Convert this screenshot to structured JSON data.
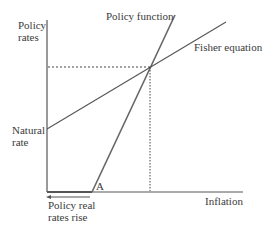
{
  "diagram": {
    "type": "economics-diagram",
    "y_axis_label": [
      "Policy",
      "rates"
    ],
    "x_axis_label": "Inflation",
    "curves": [
      {
        "name": "Policy function",
        "label": "Policy function"
      },
      {
        "name": "Fisher equation",
        "label": "Fisher equation"
      }
    ],
    "annotations": {
      "natural_rate": [
        "Natural",
        "rate"
      ],
      "point_a": "A",
      "arrow_note": [
        "Policy real",
        "rates rise"
      ]
    },
    "colors": {
      "lines": "#555555",
      "text": "#3a3a3a",
      "background": "#ffffff"
    }
  }
}
